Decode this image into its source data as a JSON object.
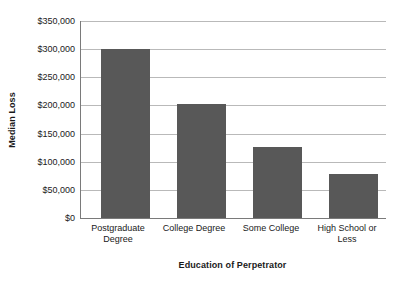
{
  "chart_data": {
    "type": "bar",
    "title": "",
    "subtitle": "",
    "xlabel": "Education of Perpetrator",
    "ylabel": "Median Loss",
    "categories": [
      "Postgraduate Degree",
      "College Degree",
      "Some College",
      "High School or Less"
    ],
    "values": [
      300000,
      203000,
      127000,
      78000
    ],
    "ylim": [
      0,
      350000
    ],
    "ytick_values": [
      0,
      50000,
      100000,
      150000,
      200000,
      250000,
      300000,
      350000
    ],
    "ytick_labels": [
      "$0",
      "$50,000",
      "$100,000",
      "$150,000",
      "$200,000",
      "$250,000",
      "$300,000",
      "$350,000"
    ],
    "grid": "horizontal",
    "legend": "none",
    "bar_color": "#585858",
    "gridline_color": "#b9b9b9",
    "axis_color": "#7a7a7a",
    "background_color": "#ffffff",
    "text_color": "#1a1a1a",
    "annotations": []
  }
}
